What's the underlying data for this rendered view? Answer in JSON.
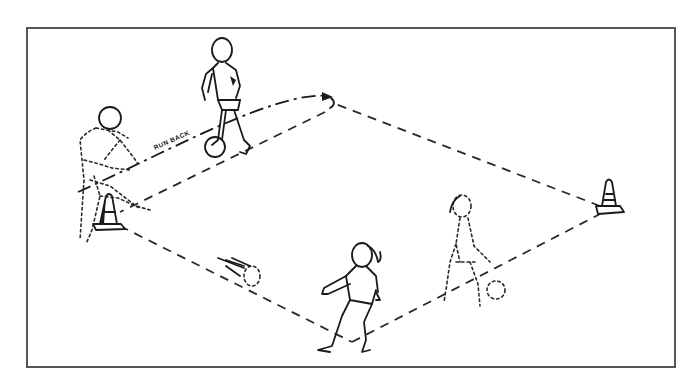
{
  "diagram": {
    "type": "soccer-drill-illustration",
    "labels": {
      "run_path": "RUN BACK"
    },
    "elements": {
      "cones": [
        "left-cone",
        "right-cone"
      ],
      "players": [
        {
          "name": "player-top-dribbling",
          "style": "solid"
        },
        {
          "name": "player-left-ghost-passing",
          "style": "dotted"
        },
        {
          "name": "player-bottom-girl-receiving",
          "style": "solid"
        },
        {
          "name": "player-right-ghost-girl",
          "style": "dotted"
        }
      ],
      "balls": [
        "ball-top",
        "ball-moving",
        "ball-right"
      ],
      "paths": [
        "square-boundary-dashed",
        "run-back-arrow"
      ]
    },
    "colors": {
      "ink": "#1a1a1a",
      "frame": "#555555",
      "background": "#ffffff"
    }
  }
}
